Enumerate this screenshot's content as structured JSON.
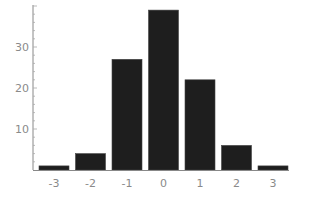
{
  "chart_data": {
    "type": "bar",
    "title": "",
    "xlabel": "",
    "ylabel": "",
    "categories": [
      "-3",
      "-2",
      "-1",
      "0",
      "1",
      "2",
      "3"
    ],
    "values": [
      1,
      4,
      27,
      39,
      22,
      6,
      1
    ],
    "ylim": [
      0,
      40
    ],
    "yticks": [
      10,
      20,
      30
    ],
    "ytick_labels": [
      "10",
      "20",
      "30"
    ],
    "xtick_labels": [
      "-3",
      "-2",
      "-1",
      "0",
      "1",
      "2",
      "3"
    ],
    "grid": false,
    "legend": null,
    "bar_color": "#1e1e1e",
    "axis_color": "#888888",
    "label_color": "#8a8a8a"
  }
}
